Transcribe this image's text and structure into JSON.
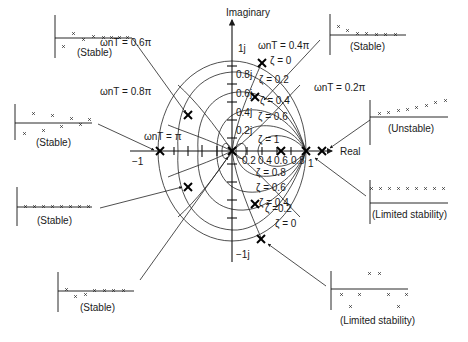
{
  "diagram": {
    "axes": {
      "imaginary_label": "Imaginary",
      "real_label": "Real",
      "real_ticks": [
        "0.2",
        "0.4",
        "0.6",
        "0.8",
        "1"
      ],
      "real_neg_label": "−1",
      "imag_ticks": [
        "1j",
        "0.8j",
        "0.6j",
        "0.4j",
        "0.2j"
      ],
      "imag_neg_label": "−1j"
    },
    "frequency_labels": [
      {
        "text": "ωnT = 0.6π"
      },
      {
        "text": "ωnT = 0.4π"
      },
      {
        "text": "ωnT = 0.8π"
      },
      {
        "text": "ωnT = 0.2π"
      },
      {
        "text": "ωnT = π"
      }
    ],
    "damping_labels_upper": [
      "ζ = 0",
      "ζ = 0.2",
      "ζ = 0.4",
      "ζ = 0.6",
      "ζ = 1"
    ],
    "damping_labels_lower": [
      "ζ = 0.8",
      "ζ = 0.6",
      "ζ = 0.4",
      "ζ =0.2",
      "ζ = 0"
    ],
    "insets": [
      {
        "id": "top-left",
        "caption": "(Stable)"
      },
      {
        "id": "top-right",
        "caption": "(Stable)"
      },
      {
        "id": "mid-left",
        "caption": "(Stable)"
      },
      {
        "id": "right-upper",
        "caption": "(Unstable)"
      },
      {
        "id": "left-lower",
        "caption": "(Stable)"
      },
      {
        "id": "right-mid",
        "caption": "(Limited stability)"
      },
      {
        "id": "bottom-left",
        "caption": "(Stable)"
      },
      {
        "id": "bottom-right",
        "caption": "(Limited stability)"
      }
    ]
  }
}
